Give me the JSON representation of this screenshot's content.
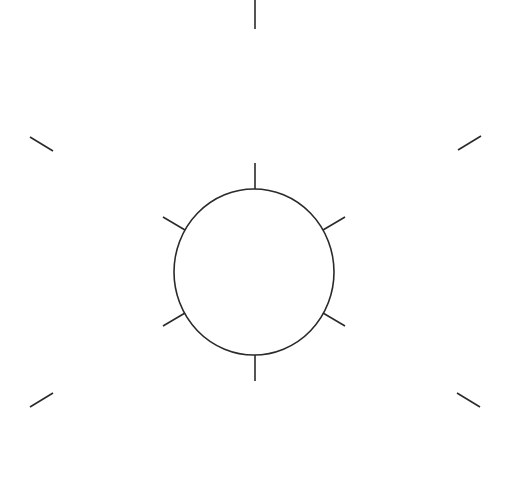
{
  "diagram": {
    "title": "",
    "stroke_color": "#2a2a2a",
    "background": "#ffffff",
    "circle": {
      "cx": 254,
      "cy": 272,
      "rx": 80,
      "ry": 83
    },
    "inner_ticks": [
      {
        "name": "tick-top",
        "x1": 255,
        "y1": 163,
        "x2": 255,
        "y2": 189
      },
      {
        "name": "tick-bottom",
        "x1": 255,
        "y1": 355,
        "x2": 255,
        "y2": 381
      },
      {
        "name": "tick-upper-left",
        "x1": 163,
        "y1": 217,
        "x2": 185,
        "y2": 230
      },
      {
        "name": "tick-upper-right",
        "x1": 345,
        "y1": 217,
        "x2": 323,
        "y2": 230
      },
      {
        "name": "tick-lower-left",
        "x1": 163,
        "y1": 326,
        "x2": 185,
        "y2": 313
      },
      {
        "name": "tick-lower-right",
        "x1": 345,
        "y1": 326,
        "x2": 323,
        "y2": 313
      }
    ],
    "outer_ticks": [
      {
        "name": "outer-top",
        "x1": 255,
        "y1": 0,
        "x2": 255,
        "y2": 29
      },
      {
        "name": "outer-upper-left",
        "x1": 30,
        "y1": 137,
        "x2": 53,
        "y2": 151
      },
      {
        "name": "outer-upper-right",
        "x1": 458,
        "y1": 150,
        "x2": 481,
        "y2": 136
      },
      {
        "name": "outer-lower-left",
        "x1": 30,
        "y1": 407,
        "x2": 53,
        "y2": 393
      },
      {
        "name": "outer-lower-right",
        "x1": 457,
        "y1": 393,
        "x2": 480,
        "y2": 407
      }
    ]
  }
}
